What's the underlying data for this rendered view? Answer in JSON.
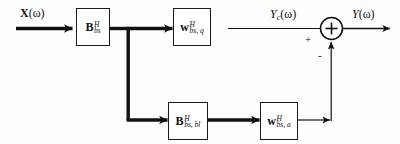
{
  "figure": {
    "background_color": "#fdfdfd",
    "line_color": "#1a1a1a"
  },
  "signals": {
    "input": {
      "name": "input-signal",
      "base": "X",
      "arg": "(ω)"
    },
    "intermediate": {
      "name": "quiescent-output",
      "base": "Y",
      "sub": "c",
      "arg": "(ω)"
    },
    "output": {
      "name": "output-signal",
      "base": "Y",
      "arg": "(ω)"
    }
  },
  "blocks": [
    {
      "id": "b-bs",
      "name": "block-b-bs",
      "base": "B",
      "sup": "H",
      "sub": "bs",
      "path": "main"
    },
    {
      "id": "w-bs-q",
      "name": "block-w-bs-q",
      "base": "w",
      "sup": "H",
      "sub": "bs, q",
      "path": "main"
    },
    {
      "id": "b-bs-bl",
      "name": "block-b-bs-bl",
      "base": "B",
      "sup": "H",
      "sub": "bs, bl",
      "path": "branch"
    },
    {
      "id": "w-bs-a",
      "name": "block-w-bs-a",
      "base": "w",
      "sup": "H",
      "sub": "bs, a",
      "path": "branch"
    }
  ],
  "summing_junction": {
    "name": "summing-junction",
    "symbol": "+",
    "plus_sign": "+",
    "minus_sign": "-"
  }
}
